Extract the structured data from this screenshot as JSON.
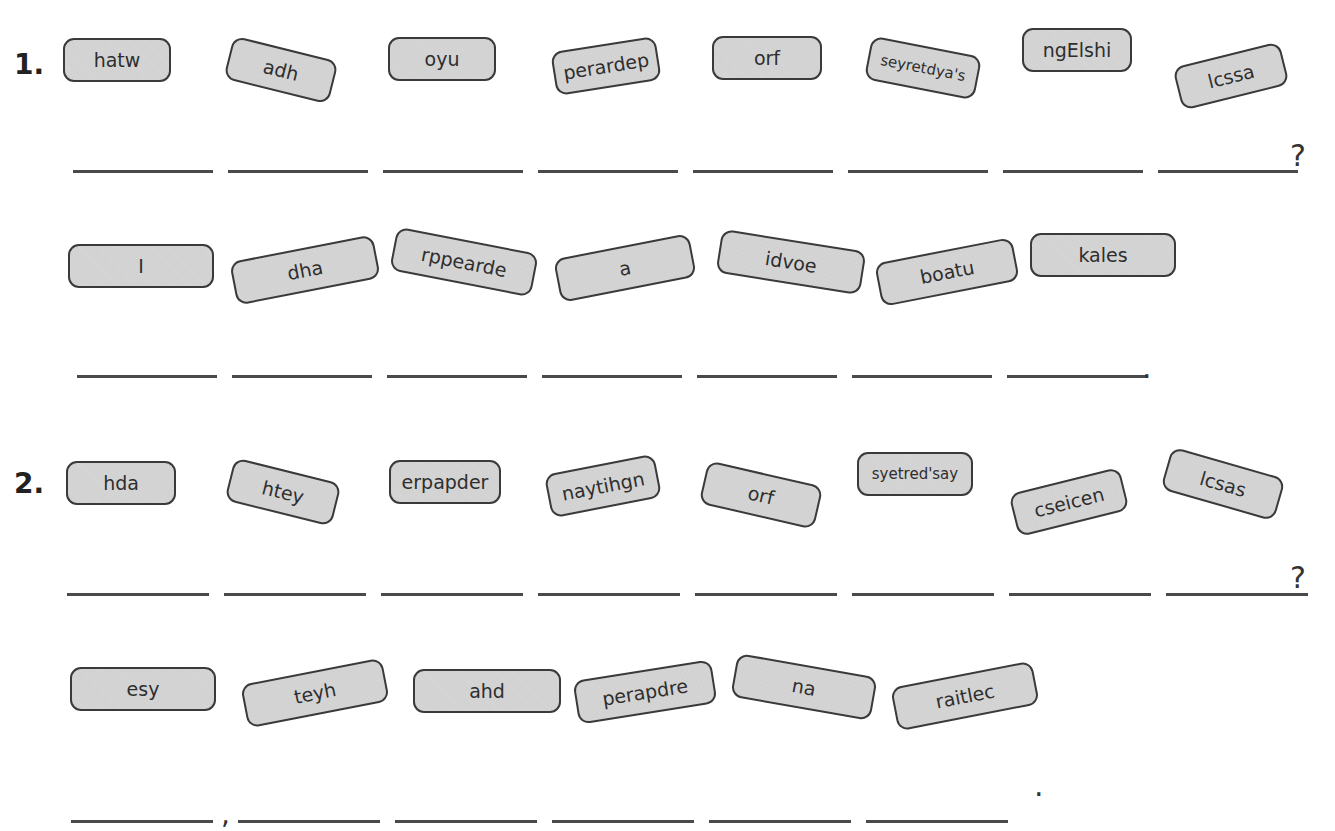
{
  "exercises": [
    {
      "number": "1.",
      "question": {
        "tiles": [
          "hatw",
          "adh",
          "oyu",
          "perardep",
          "orf",
          "seyretdya's",
          "ngElshi",
          "lcssa"
        ],
        "blank_count": 8,
        "end_punctuation": "?"
      },
      "answer": {
        "tiles": [
          "I",
          "dha",
          "rppearde",
          "a",
          "idvoe",
          "boatu",
          "kales"
        ],
        "blank_count": 7,
        "end_punctuation": "."
      }
    },
    {
      "number": "2.",
      "question": {
        "tiles": [
          "hda",
          "htey",
          "erpapder",
          "naytihgn",
          "orf",
          "syetred'say",
          "cseicen",
          "lcsas"
        ],
        "blank_count": 8,
        "end_punctuation": "?"
      },
      "answer": {
        "tiles": [
          "esy",
          "teyh",
          "ahd",
          "perapdre",
          "na",
          "raitlec"
        ],
        "blank_count": 6,
        "comma_after_blank": 1,
        "comma": ",",
        "end_punctuation": "."
      }
    }
  ],
  "colors": {
    "tile_fill": "#d2d2d2",
    "tile_border": "#3a3a3a",
    "line": "#4a4a4a"
  }
}
